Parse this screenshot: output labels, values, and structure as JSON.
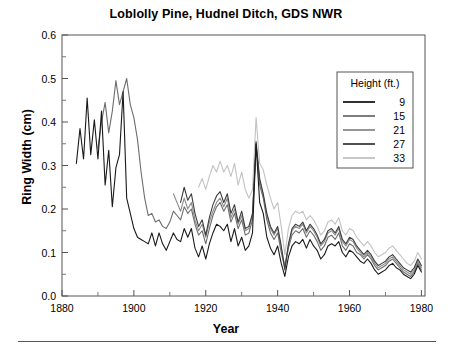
{
  "figure": {
    "title": "Loblolly Pine, Hudnel Ditch, GDS NWR",
    "xlabel": "Year",
    "ylabel": "Ring Width (cm)"
  },
  "legend": {
    "title": "Height (ft.)",
    "entries": [
      {
        "label": "9",
        "color": "#1a1a1a"
      },
      {
        "label": "15",
        "color": "#6e6e6e"
      },
      {
        "label": "21",
        "color": "#8c8c8c"
      },
      {
        "label": "27",
        "color": "#3d3d3d"
      },
      {
        "label": "33",
        "color": "#c2c2c2"
      }
    ]
  },
  "axes": {
    "x_ticks": [
      "1880",
      "1900",
      "1920",
      "1940",
      "1960",
      "1980"
    ],
    "y_ticks": [
      "0.0",
      "0.1",
      "0.2",
      "0.3",
      "0.4",
      "0.5",
      "0.6"
    ]
  },
  "chart_data": {
    "type": "line",
    "title": "Loblolly Pine, Hudnel Ditch, GDS NWR",
    "xlabel": "Year",
    "ylabel": "Ring Width (cm)",
    "xlim": [
      1880,
      1981
    ],
    "ylim": [
      0.0,
      0.6
    ],
    "xticks": [
      1880,
      1900,
      1920,
      1940,
      1960,
      1980
    ],
    "yticks": [
      0.0,
      0.1,
      0.2,
      0.3,
      0.4,
      0.5,
      0.6
    ],
    "grid": false,
    "legend_position": "upper-right",
    "legend_title": "Height (ft.)",
    "series": [
      {
        "name": "9",
        "color": "#1a1a1a",
        "x": [
          1884,
          1885,
          1886,
          1887,
          1888,
          1889,
          1890,
          1891,
          1892,
          1893,
          1894,
          1895,
          1896,
          1897,
          1898,
          1899,
          1900,
          1901,
          1902,
          1903,
          1904,
          1905,
          1906,
          1907,
          1908,
          1909,
          1910,
          1911,
          1912,
          1913,
          1914,
          1915,
          1916,
          1917,
          1918,
          1919,
          1920,
          1921,
          1922,
          1923,
          1924,
          1925,
          1926,
          1927,
          1928,
          1929,
          1930,
          1931,
          1932,
          1933,
          1934,
          1935,
          1936,
          1937,
          1938,
          1939,
          1940,
          1941,
          1942,
          1943,
          1944,
          1945,
          1946,
          1947,
          1948,
          1949,
          1950,
          1951,
          1952,
          1953,
          1954,
          1955,
          1956,
          1957,
          1958,
          1959,
          1960,
          1961,
          1962,
          1963,
          1964,
          1965,
          1966,
          1967,
          1968,
          1969,
          1970,
          1971,
          1972,
          1973,
          1974,
          1975,
          1976,
          1977,
          1978,
          1979,
          1980
        ],
        "y": [
          0.305,
          0.385,
          0.315,
          0.455,
          0.325,
          0.405,
          0.315,
          0.425,
          0.255,
          0.335,
          0.205,
          0.295,
          0.325,
          0.47,
          0.225,
          0.19,
          0.155,
          0.135,
          0.13,
          0.125,
          0.12,
          0.145,
          0.115,
          0.145,
          0.12,
          0.105,
          0.125,
          0.145,
          0.13,
          0.125,
          0.155,
          0.135,
          0.155,
          0.11,
          0.09,
          0.115,
          0.085,
          0.12,
          0.145,
          0.165,
          0.16,
          0.15,
          0.165,
          0.125,
          0.155,
          0.115,
          0.135,
          0.105,
          0.115,
          0.145,
          0.35,
          0.215,
          0.19,
          0.135,
          0.11,
          0.095,
          0.115,
          0.075,
          0.045,
          0.09,
          0.115,
          0.125,
          0.12,
          0.13,
          0.11,
          0.13,
          0.115,
          0.105,
          0.085,
          0.095,
          0.115,
          0.12,
          0.115,
          0.125,
          0.1,
          0.09,
          0.105,
          0.1,
          0.09,
          0.08,
          0.075,
          0.085,
          0.075,
          0.06,
          0.05,
          0.055,
          0.06,
          0.07,
          0.075,
          0.065,
          0.06,
          0.05,
          0.045,
          0.04,
          0.05,
          0.07,
          0.055
        ]
      },
      {
        "name": "15",
        "color": "#6e6e6e",
        "x": [
          1890,
          1891,
          1892,
          1893,
          1894,
          1895,
          1896,
          1897,
          1898,
          1899,
          1900,
          1901,
          1902,
          1903,
          1904,
          1905,
          1906,
          1907,
          1908,
          1909,
          1910,
          1911,
          1912,
          1913,
          1914,
          1915,
          1916,
          1917,
          1918,
          1919,
          1920,
          1921,
          1922,
          1923,
          1924,
          1925,
          1926,
          1927,
          1928,
          1929,
          1930,
          1931,
          1932,
          1933,
          1934,
          1935,
          1936,
          1937,
          1938,
          1939,
          1940,
          1941,
          1942,
          1943,
          1944,
          1945,
          1946,
          1947,
          1948,
          1949,
          1950,
          1951,
          1952,
          1953,
          1954,
          1955,
          1956,
          1957,
          1958,
          1959,
          1960,
          1961,
          1962,
          1963,
          1964,
          1965,
          1966,
          1967,
          1968,
          1969,
          1970,
          1971,
          1972,
          1973,
          1974,
          1975,
          1976,
          1977,
          1978,
          1979,
          1980
        ],
        "y": [
          0.34,
          0.4,
          0.445,
          0.375,
          0.425,
          0.495,
          0.44,
          0.47,
          0.5,
          0.44,
          0.41,
          0.36,
          0.285,
          0.225,
          0.185,
          0.19,
          0.17,
          0.175,
          0.16,
          0.155,
          0.17,
          0.195,
          0.185,
          0.175,
          0.205,
          0.19,
          0.2,
          0.165,
          0.14,
          0.15,
          0.12,
          0.155,
          0.185,
          0.205,
          0.215,
          0.195,
          0.21,
          0.17,
          0.19,
          0.155,
          0.175,
          0.14,
          0.145,
          0.175,
          0.35,
          0.255,
          0.225,
          0.175,
          0.145,
          0.13,
          0.145,
          0.1,
          0.065,
          0.11,
          0.14,
          0.15,
          0.145,
          0.155,
          0.135,
          0.15,
          0.14,
          0.125,
          0.105,
          0.115,
          0.135,
          0.14,
          0.13,
          0.145,
          0.115,
          0.105,
          0.12,
          0.115,
          0.1,
          0.095,
          0.085,
          0.095,
          0.085,
          0.07,
          0.06,
          0.065,
          0.07,
          0.08,
          0.085,
          0.075,
          0.065,
          0.055,
          0.05,
          0.045,
          0.055,
          0.075,
          0.06
        ]
      },
      {
        "name": "21",
        "color": "#8c8c8c",
        "x": [
          1911,
          1912,
          1913,
          1914,
          1915,
          1916,
          1917,
          1918,
          1919,
          1920,
          1921,
          1922,
          1923,
          1924,
          1925,
          1926,
          1927,
          1928,
          1929,
          1930,
          1931,
          1932,
          1933,
          1934,
          1935,
          1936,
          1937,
          1938,
          1939,
          1940,
          1941,
          1942,
          1943,
          1944,
          1945,
          1946,
          1947,
          1948,
          1949,
          1950,
          1951,
          1952,
          1953,
          1954,
          1955,
          1956,
          1957,
          1958,
          1959,
          1960,
          1961,
          1962,
          1963,
          1964,
          1965,
          1966,
          1967,
          1968,
          1969,
          1970,
          1971,
          1972,
          1973,
          1974,
          1975,
          1976,
          1977,
          1978,
          1979,
          1980
        ],
        "y": [
          0.235,
          0.215,
          0.195,
          0.225,
          0.2,
          0.215,
          0.175,
          0.15,
          0.165,
          0.135,
          0.17,
          0.195,
          0.215,
          0.225,
          0.205,
          0.225,
          0.18,
          0.2,
          0.165,
          0.185,
          0.15,
          0.155,
          0.185,
          0.345,
          0.265,
          0.23,
          0.185,
          0.155,
          0.14,
          0.155,
          0.11,
          0.07,
          0.115,
          0.15,
          0.16,
          0.155,
          0.165,
          0.145,
          0.16,
          0.15,
          0.135,
          0.115,
          0.125,
          0.145,
          0.15,
          0.14,
          0.155,
          0.125,
          0.115,
          0.13,
          0.125,
          0.11,
          0.1,
          0.09,
          0.1,
          0.09,
          0.075,
          0.065,
          0.07,
          0.075,
          0.085,
          0.09,
          0.08,
          0.07,
          0.06,
          0.055,
          0.05,
          0.06,
          0.08,
          0.065
        ]
      },
      {
        "name": "27",
        "color": "#3d3d3d",
        "x": [
          1913,
          1914,
          1915,
          1916,
          1917,
          1918,
          1919,
          1920,
          1921,
          1922,
          1923,
          1924,
          1925,
          1926,
          1927,
          1928,
          1929,
          1930,
          1931,
          1932,
          1933,
          1934,
          1935,
          1936,
          1937,
          1938,
          1939,
          1940,
          1941,
          1942,
          1943,
          1944,
          1945,
          1946,
          1947,
          1948,
          1949,
          1950,
          1951,
          1952,
          1953,
          1954,
          1955,
          1956,
          1957,
          1958,
          1959,
          1960,
          1961,
          1962,
          1963,
          1964,
          1965,
          1966,
          1967,
          1968,
          1969,
          1970,
          1971,
          1972,
          1973,
          1974,
          1975,
          1976,
          1977,
          1978,
          1979,
          1980
        ],
        "y": [
          0.215,
          0.25,
          0.22,
          0.235,
          0.19,
          0.16,
          0.175,
          0.14,
          0.18,
          0.21,
          0.23,
          0.24,
          0.215,
          0.235,
          0.19,
          0.21,
          0.17,
          0.195,
          0.155,
          0.16,
          0.19,
          0.355,
          0.27,
          0.235,
          0.19,
          0.16,
          0.145,
          0.16,
          0.115,
          0.06,
          0.12,
          0.155,
          0.165,
          0.16,
          0.17,
          0.15,
          0.165,
          0.155,
          0.14,
          0.12,
          0.13,
          0.15,
          0.155,
          0.145,
          0.16,
          0.13,
          0.12,
          0.135,
          0.13,
          0.115,
          0.105,
          0.095,
          0.105,
          0.095,
          0.08,
          0.07,
          0.075,
          0.08,
          0.09,
          0.095,
          0.085,
          0.075,
          0.065,
          0.06,
          0.055,
          0.065,
          0.085,
          0.07
        ]
      },
      {
        "name": "33",
        "color": "#c2c2c2",
        "x": [
          1918,
          1919,
          1920,
          1921,
          1922,
          1923,
          1924,
          1925,
          1926,
          1927,
          1928,
          1929,
          1930,
          1931,
          1932,
          1933,
          1934,
          1935,
          1936,
          1937,
          1938,
          1939,
          1940,
          1941,
          1942,
          1943,
          1944,
          1945,
          1946,
          1947,
          1948,
          1949,
          1950,
          1951,
          1952,
          1953,
          1954,
          1955,
          1956,
          1957,
          1958,
          1959,
          1960,
          1961,
          1962,
          1963,
          1964,
          1965,
          1966,
          1967,
          1968,
          1969,
          1970,
          1971,
          1972,
          1973,
          1974,
          1975,
          1976,
          1977,
          1978,
          1979,
          1980
        ],
        "y": [
          0.25,
          0.27,
          0.245,
          0.275,
          0.3,
          0.285,
          0.31,
          0.285,
          0.3,
          0.275,
          0.305,
          0.255,
          0.285,
          0.245,
          0.225,
          0.245,
          0.41,
          0.305,
          0.29,
          0.255,
          0.225,
          0.2,
          0.215,
          0.16,
          0.095,
          0.155,
          0.185,
          0.195,
          0.19,
          0.195,
          0.175,
          0.185,
          0.175,
          0.16,
          0.14,
          0.15,
          0.17,
          0.175,
          0.165,
          0.18,
          0.15,
          0.14,
          0.155,
          0.15,
          0.135,
          0.125,
          0.115,
          0.125,
          0.115,
          0.1,
          0.09,
          0.095,
          0.1,
          0.11,
          0.115,
          0.105,
          0.095,
          0.085,
          0.075,
          0.07,
          0.08,
          0.1,
          0.085
        ]
      }
    ]
  }
}
